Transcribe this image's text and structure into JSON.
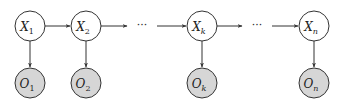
{
  "diagram": {
    "type": "hidden-markov-model",
    "colors": {
      "stroke": "#333333",
      "hidden_fill": "#ffffff",
      "observed_fill": "#d6d6d6",
      "background": "#ffffff"
    },
    "hidden_nodes": [
      {
        "id": "X1",
        "main": "X",
        "sub": "1",
        "cx": 30,
        "cy": 26
      },
      {
        "id": "X2",
        "main": "X",
        "sub": "2",
        "cx": 86,
        "cy": 26
      },
      {
        "id": "Xk",
        "main": "X",
        "sub": "k",
        "cx": 202,
        "cy": 26
      },
      {
        "id": "Xn",
        "main": "X",
        "sub": "n",
        "cx": 314,
        "cy": 26
      }
    ],
    "observed_nodes": [
      {
        "id": "O1",
        "main": "O",
        "sub": "1",
        "cx": 30,
        "cy": 83
      },
      {
        "id": "O2",
        "main": "O",
        "sub": "2",
        "cx": 86,
        "cy": 83
      },
      {
        "id": "Ok",
        "main": "O",
        "sub": "k",
        "cx": 202,
        "cy": 83
      },
      {
        "id": "On",
        "main": "O",
        "sub": "n",
        "cx": 314,
        "cy": 83
      }
    ],
    "ellipsis": "···",
    "edges": [
      {
        "from": "X1",
        "to": "X2"
      },
      {
        "from": "X2",
        "to": "ellipsis-1"
      },
      {
        "from": "ellipsis-1",
        "to": "Xk"
      },
      {
        "from": "Xk",
        "to": "ellipsis-2"
      },
      {
        "from": "ellipsis-2",
        "to": "Xn"
      },
      {
        "from": "X1",
        "to": "O1"
      },
      {
        "from": "X2",
        "to": "O2"
      },
      {
        "from": "Xk",
        "to": "Ok"
      },
      {
        "from": "Xn",
        "to": "On"
      }
    ]
  }
}
